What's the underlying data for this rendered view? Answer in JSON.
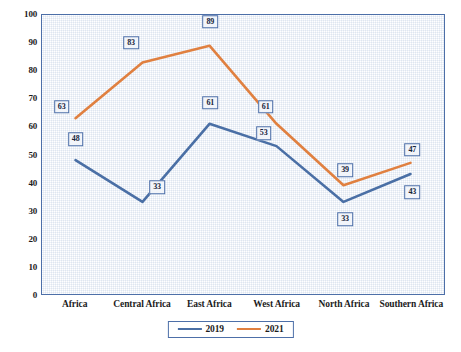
{
  "chart_data": {
    "type": "line",
    "title": "",
    "xlabel": "",
    "ylabel": "",
    "categories": [
      "Africa",
      "Central Africa",
      "East Africa",
      "West Africa",
      "North Africa",
      "Southern Africa"
    ],
    "series": [
      {
        "name": "2019",
        "color": "#4a6fa5",
        "values": [
          48,
          33,
          61,
          53,
          33,
          43
        ]
      },
      {
        "name": "2021",
        "color": "#e08040",
        "values": [
          63,
          83,
          89,
          61,
          39,
          47
        ]
      }
    ],
    "ylim": [
      0,
      100
    ],
    "ytick_step": 10,
    "yticks": [
      "100",
      "90",
      "80",
      "70",
      "60",
      "50",
      "40",
      "30",
      "20",
      "10",
      "0"
    ],
    "grid": false,
    "legend_position": "bottom",
    "data_labels_shown": true
  },
  "legend": {
    "items": [
      {
        "label": "2019",
        "color": "#4a6fa5"
      },
      {
        "label": "2021",
        "color": "#e08040"
      }
    ]
  },
  "colors": {
    "series_2019": "#4a6fa5",
    "series_2021": "#e08040",
    "plot_border": "#4d6fa8",
    "plot_background": "#eef2f8",
    "label_border": "#4d6fa8",
    "text": "#1c1c1c"
  }
}
